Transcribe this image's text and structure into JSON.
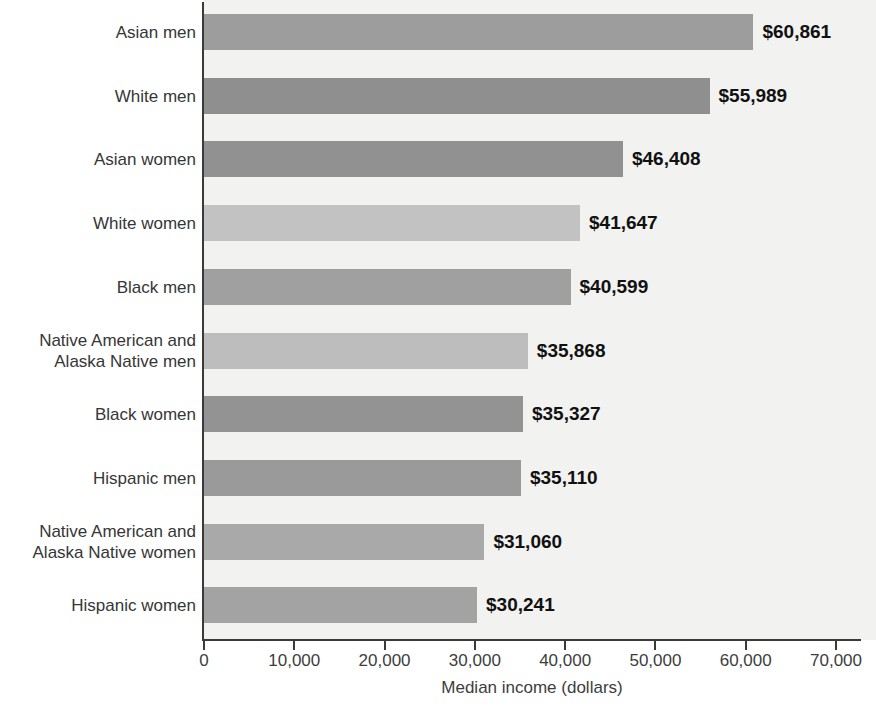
{
  "chart_data": {
    "type": "bar",
    "orientation": "horizontal",
    "title": "",
    "xlabel": "Median income (dollars)",
    "ylabel": "",
    "xlim": [
      0,
      70000
    ],
    "xticks": [
      0,
      10000,
      20000,
      30000,
      40000,
      50000,
      60000,
      70000
    ],
    "xtick_labels": [
      "0",
      "10,000",
      "20,000",
      "30,000",
      "40,000",
      "50,000",
      "60,000",
      "70,000"
    ],
    "grid": false,
    "legend": null,
    "categories": [
      "Asian men",
      "White men",
      "Asian women",
      "White women",
      "Black men",
      "Native American and\nAlaska Native men",
      "Black women",
      "Hispanic men",
      "Native American and\nAlaska Native women",
      "Hispanic women"
    ],
    "values": [
      60861,
      55989,
      46408,
      41647,
      40599,
      35868,
      35327,
      35110,
      31060,
      30241
    ],
    "value_labels": [
      "$60,861",
      "$55,989",
      "$46,408",
      "$41,647",
      "$40,599",
      "$35,868",
      "$35,327",
      "$35,110",
      "$31,060",
      "$30,241"
    ],
    "bar_colors": [
      "#9d9d9d",
      "#8f8f8f",
      "#919191",
      "#c2c2c2",
      "#a0a0a0",
      "#bdbdbd",
      "#939393",
      "#9a9a9a",
      "#a9a9a9",
      "#a3a3a3"
    ]
  },
  "style": {
    "plot_background": "#f2f2f1",
    "axis_color": "#3a3a3a",
    "label_color": "#363636",
    "value_label_color": "#111111",
    "page_background": "#ffffff"
  }
}
